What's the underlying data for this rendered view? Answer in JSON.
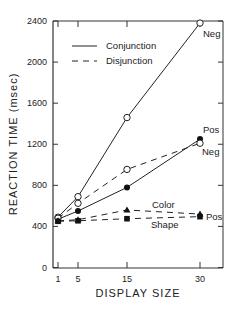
{
  "chart_data": {
    "type": "line",
    "title": "",
    "xlabel": "DISPLAY SIZE",
    "ylabel": "REACTION TIME (msec)",
    "x": [
      1,
      5,
      15,
      30
    ],
    "xticks": [
      "1",
      "5",
      "15",
      "30"
    ],
    "yticks": [
      "0",
      "400",
      "800",
      "1200",
      "1600",
      "2000",
      "2400"
    ],
    "ylim": [
      0,
      2400
    ],
    "grid": false,
    "legend": {
      "position": "upper-left",
      "entries": [
        {
          "label": "Conjunction",
          "style": "solid"
        },
        {
          "label": "Disjunction",
          "style": "dashed"
        }
      ]
    },
    "series": [
      {
        "name": "Conjunction Neg",
        "condition": "Conjunction",
        "trial": "Neg",
        "style": "solid",
        "marker": "open-circle",
        "values": [
          490,
          690,
          1460,
          2380
        ]
      },
      {
        "name": "Conjunction Pos",
        "condition": "Conjunction",
        "trial": "Pos",
        "style": "solid",
        "marker": "filled-circle",
        "values": [
          470,
          550,
          780,
          1250
        ]
      },
      {
        "name": "Disjunction Neg",
        "condition": "Disjunction",
        "trial": "Neg",
        "style": "dashed",
        "marker": "open-circle",
        "values": [
          480,
          625,
          955,
          1210
        ]
      },
      {
        "name": "Disjunction Color Pos",
        "condition": "Disjunction",
        "trial": "Pos",
        "feature": "Color",
        "style": "dashed",
        "marker": "filled-triangle",
        "values": [
          455,
          465,
          560,
          520
        ]
      },
      {
        "name": "Disjunction Shape Pos",
        "condition": "Disjunction",
        "trial": "Pos",
        "feature": "Shape",
        "style": "dashed",
        "marker": "filled-square",
        "values": [
          450,
          455,
          475,
          495
        ]
      }
    ],
    "annotations": [
      {
        "text": "Neg",
        "near": "Conjunction Neg @ 30"
      },
      {
        "text": "Pos",
        "near": "Conjunction Pos @ 30"
      },
      {
        "text": "Neg",
        "near": "Disjunction Neg @ 30"
      },
      {
        "text": "Color",
        "near": "Disjunction Color Pos line"
      },
      {
        "text": "Shape",
        "near": "Disjunction Shape Pos line"
      },
      {
        "text": "Pos",
        "near": "Disjunction Color/Shape @ 30"
      }
    ]
  },
  "labels": {
    "xlabel": "DISPLAY SIZE",
    "ylabel": "REACTION TIME (msec)",
    "legend_solid": "Conjunction",
    "legend_dashed": "Disjunction",
    "anno_conj_neg": "Neg",
    "anno_conj_pos": "Pos",
    "anno_disj_neg": "Neg",
    "anno_color": "Color",
    "anno_shape": "Shape",
    "anno_disj_pos": "Pos"
  }
}
